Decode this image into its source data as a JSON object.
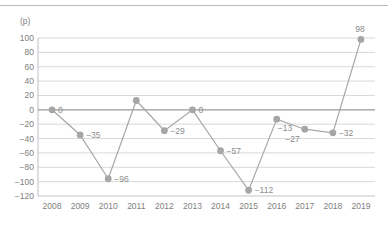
{
  "chart_data": {
    "type": "line",
    "title": "",
    "xlabel": "",
    "ylabel": "",
    "unit_label": "(p)",
    "categories": [
      "2008",
      "2009",
      "2010",
      "2011",
      "2012",
      "2013",
      "2014",
      "2015",
      "2016",
      "2017",
      "2018",
      "2019"
    ],
    "values": [
      0,
      -35,
      -96,
      13,
      -29,
      0,
      -57,
      -112,
      -13,
      -27,
      -32,
      98
    ],
    "point_labels": [
      "0",
      "-35",
      "-96",
      "",
      "-29",
      "0",
      "-57",
      "-112",
      "-13",
      "-27",
      "-32",
      "98"
    ],
    "point_labels_display": [
      "0",
      "−35",
      "−96",
      "",
      "−29",
      "0",
      "−57",
      "−112",
      "−13",
      "−27",
      "−32",
      "98"
    ],
    "label_positions": [
      "right",
      "right",
      "right",
      "none",
      "right",
      "right",
      "right",
      "right",
      "below-right",
      "below-left",
      "right",
      "above"
    ],
    "ylim": [
      -120,
      100
    ],
    "ytick_values": [
      100,
      80,
      60,
      40,
      20,
      0,
      -20,
      -40,
      -60,
      -80,
      -100,
      -120
    ],
    "ytick_labels": [
      "100",
      "80",
      "60",
      "40",
      "20",
      "0",
      "−20",
      "−40",
      "−60",
      "−80",
      "−100",
      "−120"
    ],
    "grid": true,
    "legend": false,
    "legend_position": "none",
    "series_color": "#a6a6a6",
    "marker_color": "#a6a6a6",
    "grid_color": "#d9d9d9",
    "zero_line_color": "#9a9a9a",
    "axis_color": "#bfbfbf",
    "text_color": "#808080"
  }
}
